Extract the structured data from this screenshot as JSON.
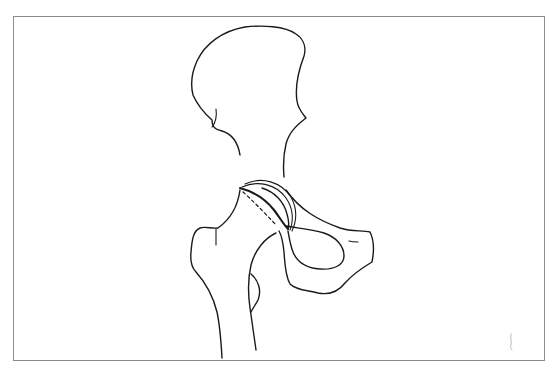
{
  "figure": {
    "type": "anatomical line drawing",
    "frame": {
      "border_color": "#8c8c8c",
      "background": "#ffffff"
    },
    "line_color": "#1a1a1a",
    "parts": [
      {
        "id": "ilium",
        "description": "iliac wing outline"
      },
      {
        "id": "acetabulum",
        "description": "acetabular rim arcs"
      },
      {
        "id": "femoral-head",
        "description": "femoral head with thick articular contour"
      },
      {
        "id": "femoral-neck-line",
        "description": "dashed line across femoral neck"
      },
      {
        "id": "greater-trochanter",
        "description": "greater trochanter outline"
      },
      {
        "id": "femoral-shaft",
        "description": "proximal femoral shaft outlines"
      },
      {
        "id": "lesser-trochanter",
        "description": "lesser trochanter bump"
      },
      {
        "id": "obturator-foramen",
        "description": "obturator foramen loop"
      },
      {
        "id": "pubis",
        "description": "pubic ramus / pubis outline"
      },
      {
        "id": "corner-mark",
        "description": "faint mark near lower right corner"
      }
    ]
  }
}
